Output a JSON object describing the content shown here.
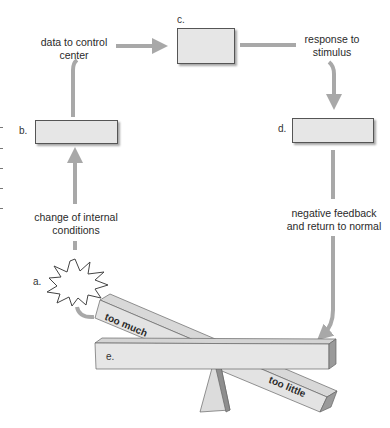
{
  "diagram": {
    "type": "homeostasis negative feedback loop",
    "nodes": [
      {
        "id": "a",
        "letter": "a.",
        "shape": "starburst",
        "label": ""
      },
      {
        "id": "b",
        "letter": "b.",
        "shape": "box",
        "label": ""
      },
      {
        "id": "c",
        "letter": "c.",
        "shape": "box",
        "label": ""
      },
      {
        "id": "d",
        "letter": "d.",
        "shape": "box",
        "label": ""
      },
      {
        "id": "e",
        "letter": "e.",
        "shape": "seesaw-beam",
        "label": ""
      }
    ],
    "edges": [
      {
        "from": "a",
        "to": "b",
        "label": "change of internal conditions"
      },
      {
        "from": "b",
        "to": "c",
        "label": "data to control center"
      },
      {
        "from": "c",
        "to": "d",
        "label": "response to stimulus"
      },
      {
        "from": "d",
        "to": "e",
        "label": "negative feedback and return to normal"
      },
      {
        "from": "e",
        "to": "a",
        "label": ""
      }
    ],
    "edge_labels": {
      "change_line1": "change of internal",
      "change_line2": "conditions",
      "data_line1": "data to control",
      "data_line2": "center",
      "response_line1": "response to",
      "response_line2": "stimulus",
      "negative_line1": "negative feedback",
      "negative_line2": "and return to normal"
    },
    "letters": {
      "a": "a.",
      "b": "b.",
      "c": "c.",
      "d": "d.",
      "e": "e."
    },
    "beam_labels": {
      "tilted_high": "too much",
      "tilted_low": "too little"
    },
    "colors": {
      "arrow": "#a8a8a8",
      "box_fill": "#e6e6e6",
      "box_border": "#555555",
      "beam_top": "#d9d9d9",
      "beam_front": "#e4e4e4",
      "beam_end": "#9a9a9a"
    }
  }
}
